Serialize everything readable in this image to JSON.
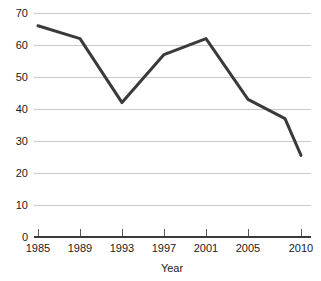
{
  "chart_data": {
    "type": "line",
    "title": "",
    "xlabel": "Year",
    "ylabel": "",
    "x": [
      1985,
      1989,
      1993,
      1997,
      2001,
      2005,
      2009,
      2010
    ],
    "values": [
      66,
      62,
      42,
      57,
      62,
      43,
      37,
      25.5
    ],
    "series": [
      {
        "name": "series-1",
        "values": [
          66,
          62,
          42,
          57,
          62,
          43,
          37,
          25.5
        ],
        "color": "#3a3a3a"
      }
    ],
    "xlim": [
      1985,
      2010
    ],
    "ylim": [
      0,
      70
    ],
    "x_tick_labels": [
      "1985",
      "1989",
      "1993",
      "1997",
      "2001",
      "2005",
      "2010"
    ],
    "x_tick_values": [
      1985,
      1989,
      1993,
      1997,
      2001,
      2005,
      2010
    ],
    "y_tick_labels": [
      "0",
      "10",
      "20",
      "30",
      "40",
      "50",
      "60",
      "70"
    ],
    "y_tick_values": [
      0,
      10,
      20,
      30,
      40,
      50,
      60,
      70
    ],
    "grid": true,
    "grid_axis": "y",
    "legend": false,
    "legend_position": "none",
    "annotations": []
  },
  "colors": {
    "background": "#ffffff",
    "line": "#3a3a3a",
    "gridline": "#c9c9c9",
    "axis": "#3a3a3a",
    "text": "#1a1a1a"
  },
  "geometry": {
    "plot_left": 34,
    "plot_right": 311,
    "plot_top": 13,
    "plot_bottom": 237,
    "x_tick_pixels": [
      38,
      80,
      122,
      164,
      206,
      248,
      301
    ],
    "point_pixels_x": [
      38,
      80,
      122,
      164,
      206,
      248,
      285,
      301
    ],
    "xlabel_x": 172,
    "xlabel_y": 272
  }
}
